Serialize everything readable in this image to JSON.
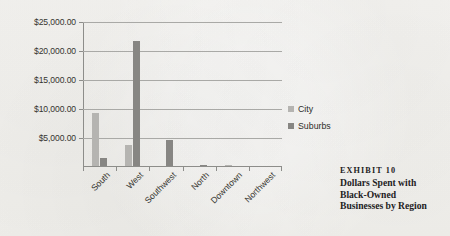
{
  "chart_data": {
    "type": "bar",
    "title": "",
    "xlabel": "",
    "ylabel": "",
    "categories": [
      "South",
      "West",
      "Southwest",
      "North",
      "Downtown",
      "Northwest"
    ],
    "series": [
      {
        "name": "City",
        "color": "#b5b4b1",
        "values": [
          9200,
          3650,
          0,
          0,
          120,
          0
        ]
      },
      {
        "name": "Suburbs",
        "color": "#878683",
        "values": [
          1300,
          21600,
          4400,
          60,
          0,
          0
        ]
      }
    ],
    "ylim": [
      0,
      25000
    ],
    "ytick_values": [
      5000,
      10000,
      15000,
      20000,
      25000
    ],
    "ytick_labels": [
      "$5,000.00",
      "$10,000.00",
      "$15,000.00",
      "$20,000.00",
      "$25,000.00"
    ],
    "grid": true,
    "legend_position": "right"
  },
  "legend": {
    "items": [
      {
        "label": "City"
      },
      {
        "label": "Suburbs"
      }
    ]
  },
  "caption": {
    "exhibit": "EXHIBIT 10",
    "lines": [
      "Dollars Spent with",
      "Black-Owned",
      "Businesses by Region"
    ]
  }
}
